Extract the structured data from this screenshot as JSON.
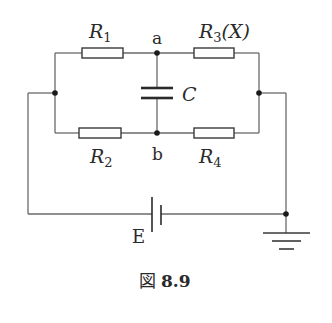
{
  "diagram": {
    "type": "circuit-bridge",
    "labels": {
      "r1": {
        "main": "R",
        "sub": "1"
      },
      "r2": {
        "main": "R",
        "sub": "2"
      },
      "r3": {
        "main": "R",
        "sub": "3",
        "suffix": "(X)"
      },
      "r4": {
        "main": "R",
        "sub": "4"
      },
      "node_a": "a",
      "node_b": "b",
      "capacitor": "C",
      "battery": "E"
    },
    "caption": {
      "prefix": "図",
      "number": "8.9"
    },
    "colors": {
      "wire": "#6a6a6a",
      "component": "#3a3a3a",
      "text": "#2a2a2a"
    }
  }
}
